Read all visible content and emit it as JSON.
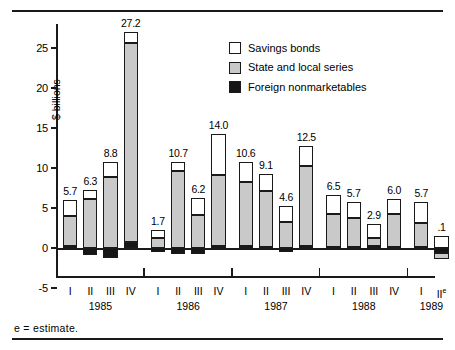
{
  "axis": {
    "ylabel": "$ billions",
    "yticks": [
      "25",
      "20",
      "15",
      "10",
      "5",
      "0",
      "-5"
    ],
    "ytick_values": [
      25,
      20,
      15,
      10,
      5,
      0,
      -5
    ]
  },
  "legend": {
    "items": [
      {
        "label": "Savings bonds",
        "color": "#ffffff",
        "key": "savings"
      },
      {
        "label": "State and local series",
        "color": "#c9c9c9",
        "key": "state_local"
      },
      {
        "label": "Foreign nonmarketables",
        "color": "#161616",
        "key": "foreign"
      }
    ]
  },
  "footnote": "e = estimate.",
  "years": [
    {
      "year": "1985",
      "quarters": [
        "I",
        "II",
        "III",
        "IV"
      ]
    },
    {
      "year": "1986",
      "quarters": [
        "I",
        "II",
        "III",
        "IV"
      ]
    },
    {
      "year": "1987",
      "quarters": [
        "I",
        "II",
        "III",
        "IV"
      ]
    },
    {
      "year": "1988",
      "quarters": [
        "I",
        "II",
        "III",
        "IV"
      ]
    },
    {
      "year": "1989",
      "quarters": [
        "I",
        "II"
      ],
      "estimate_on_last": true
    }
  ],
  "chart_data": {
    "type": "bar",
    "subtype": "stacked-bar-with-negatives",
    "title": "",
    "xlabel": "",
    "ylabel": "$ billions",
    "ylim": [
      -5,
      28
    ],
    "yticks": [
      -5,
      0,
      5,
      10,
      15,
      20,
      25
    ],
    "grid": false,
    "legend_position": "top-right",
    "categories": [
      "1985 I",
      "1985 II",
      "1985 III",
      "1985 IV",
      "1986 I",
      "1986 II",
      "1986 III",
      "1986 IV",
      "1987 I",
      "1987 II",
      "1987 III",
      "1987 IV",
      "1988 I",
      "1988 II",
      "1988 III",
      "1988 IV",
      "1989 I",
      "1989 II"
    ],
    "series": [
      {
        "name": "Savings bonds",
        "color": "#ffffff",
        "values": [
          2.0,
          1.1,
          1.9,
          1.4,
          1.0,
          1.1,
          2.1,
          5.1,
          2.5,
          2.1,
          1.9,
          2.4,
          2.4,
          2.1,
          1.7,
          1.9,
          2.7,
          1.5
        ]
      },
      {
        "name": "State and local series",
        "color": "#c9c9c9",
        "values": [
          3.7,
          6.1,
          8.9,
          24.8,
          1.2,
          9.6,
          4.1,
          8.9,
          8.1,
          7.0,
          3.3,
          10.1,
          4.1,
          3.6,
          1.0,
          4.1,
          3.0,
          -0.8
        ]
      },
      {
        "name": "Foreign nonmarketables",
        "color": "#161616",
        "values": [
          0.3,
          -0.9,
          -1.3,
          0.8,
          -0.5,
          -0.7,
          -0.7,
          0.2,
          0.2,
          0.1,
          -0.5,
          0.2,
          0.1,
          0.1,
          0.3,
          0.1,
          0.1,
          -0.6
        ]
      }
    ],
    "totals": [
      5.7,
      6.3,
      8.8,
      27.2,
      1.7,
      10.7,
      6.2,
      14.0,
      10.6,
      9.1,
      4.6,
      12.5,
      6.5,
      5.7,
      2.9,
      6.0,
      5.7,
      0.1
    ],
    "data_labels": [
      "5.7",
      "6.3",
      "8.8",
      "27.2",
      "1.7",
      "10.7",
      "6.2",
      "14.0",
      "10.6",
      "9.1",
      "4.6",
      "12.5",
      "6.5",
      "5.7",
      "2.9",
      "6.0",
      "5.7",
      ".1"
    ]
  }
}
